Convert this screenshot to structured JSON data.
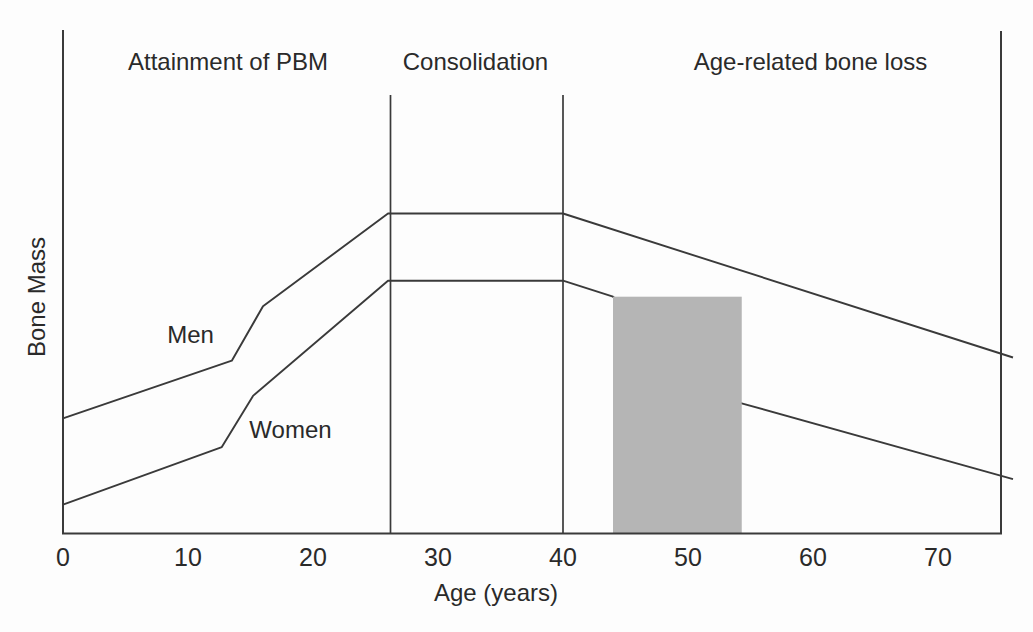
{
  "figure": {
    "background": "#fdfdfd",
    "line_color": "#3a3a3a",
    "text_color": "#2a2a2a",
    "band_color": "#b5b5b5"
  },
  "chart_data": {
    "type": "line",
    "title": "",
    "xlabel": "Age (years)",
    "ylabel": "Bone Mass",
    "x_ticks": [
      0,
      10,
      20,
      30,
      40,
      50,
      60,
      70
    ],
    "x_range": [
      0,
      75
    ],
    "y_range": [
      0,
      105
    ],
    "value_units": "arbitrary (unlabeled axis; peak male bone mass = 100)",
    "grid": false,
    "legend_position": "inline-labels",
    "series": [
      {
        "name": "Men",
        "label_pos": {
          "age": 10.2,
          "value": 59.4
        },
        "points": [
          [
            0,
            36
          ],
          [
            13.5,
            54
          ],
          [
            16,
            71
          ],
          [
            26,
            100
          ],
          [
            40,
            100
          ],
          [
            76,
            55
          ]
        ]
      },
      {
        "name": "Women",
        "label_pos": {
          "age": 18.2,
          "value": 30
        },
        "points": [
          [
            0,
            9
          ],
          [
            12.7,
            27
          ],
          [
            15.2,
            43
          ],
          [
            26,
            79
          ],
          [
            40,
            79
          ],
          [
            44,
            74
          ],
          [
            54,
            41
          ],
          [
            76,
            17
          ]
        ]
      }
    ],
    "phases": [
      {
        "label": "Attainment of PBM",
        "center_age": 13.2
      },
      {
        "label": "Consolidation",
        "center_age": 33
      },
      {
        "label": "Age-related bone loss",
        "center_age": 59.8
      }
    ],
    "phase_dividers_age": [
      26.2,
      40
    ],
    "shaded_band": {
      "from_age": 44,
      "to_age": 54.3,
      "top_value": 74
    }
  }
}
